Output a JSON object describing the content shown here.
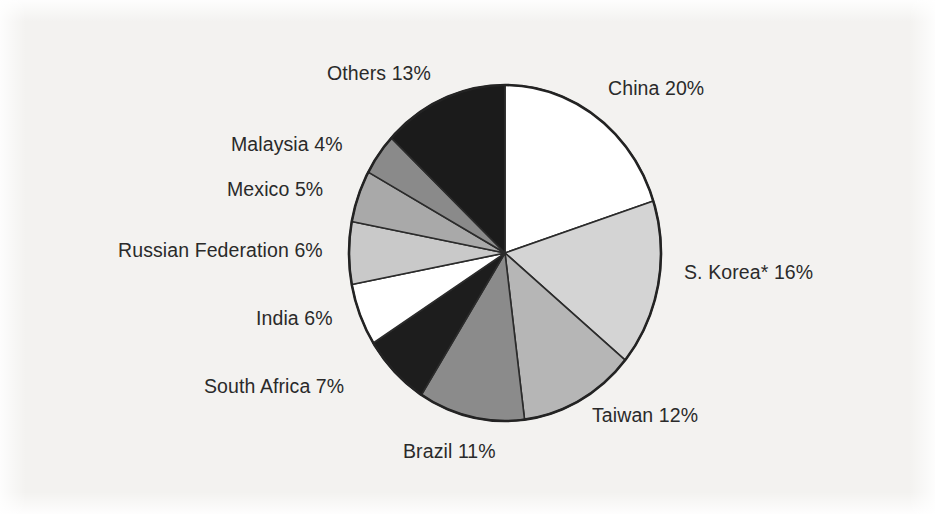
{
  "chart_data": {
    "type": "pie",
    "title": "",
    "subtitle": "",
    "xlabel": "",
    "ylabel": "",
    "legend_position": "none",
    "grid": false,
    "labels_inline": true,
    "units": "percent",
    "start_angle_deg": 0,
    "direction": "clockwise",
    "categories": [
      "China",
      "S. Korea*",
      "Taiwan",
      "Brazil",
      "South Africa",
      "India",
      "Russian Federation",
      "Mexico",
      "Malaysia",
      "Others"
    ],
    "values": [
      20,
      16,
      12,
      11,
      7,
      6,
      6,
      5,
      4,
      13
    ],
    "slices": [
      {
        "name": "China",
        "value": 20,
        "label": "China 20%",
        "color": "#ffffff"
      },
      {
        "name": "S. Korea*",
        "value": 16,
        "label": "S. Korea* 16%",
        "color": "#d4d4d4"
      },
      {
        "name": "Taiwan",
        "value": 12,
        "label": "Taiwan 12%",
        "color": "#b6b6b6"
      },
      {
        "name": "Brazil",
        "value": 11,
        "label": "Brazil 11%",
        "color": "#8b8b8b"
      },
      {
        "name": "South Africa",
        "value": 7,
        "label": "South Africa 7%",
        "color": "#1d1d1d"
      },
      {
        "name": "India",
        "value": 6,
        "label": "India 6%",
        "color": "#ffffff"
      },
      {
        "name": "Russian Federation",
        "value": 6,
        "label": "Russian Federation 6%",
        "color": "#c9c9c9"
      },
      {
        "name": "Mexico",
        "value": 5,
        "label": "Mexico 5%",
        "color": "#a9a9a9"
      },
      {
        "name": "Malaysia",
        "value": 4,
        "label": "Malaysia 4%",
        "color": "#8a8a8a"
      },
      {
        "name": "Others",
        "value": 13,
        "label": "Others 13%",
        "color": "#1b1b1b"
      }
    ],
    "total": 100,
    "slice_outline_color": "#2b2b2b",
    "background_color": "#f3f2f0"
  },
  "labels": {
    "others": "Others 13%",
    "china": "China 20%",
    "malaysia": "Malaysia 4%",
    "mexico": "Mexico 5%",
    "russian_federation": "Russian Federation 6%",
    "s_korea": "S. Korea* 16%",
    "india": "India 6%",
    "south_africa": "South Africa 7%",
    "taiwan": "Taiwan 12%",
    "brazil": "Brazil 11%"
  }
}
